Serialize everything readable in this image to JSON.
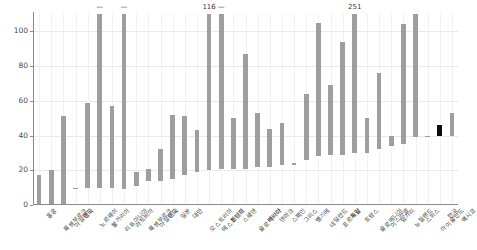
{
  "chart_data": {
    "type": "bar",
    "bar_style": "floating-range",
    "title": "",
    "subtitle": "",
    "xlabel": "",
    "ylabel": "",
    "ylim": [
      0,
      110
    ],
    "y_ticks": [
      0,
      20,
      40,
      60,
      80,
      100
    ],
    "grid": true,
    "legend": null,
    "orientation": "vertical",
    "sorted": "ascending by upper value",
    "clip_value": 110,
    "note": "Each bar spans from a lower value to an upper value. Bars reaching 110 are clipped and carry a numeric annotation of their true upper value.",
    "colors": {
      "bar": "#9e9e9e",
      "highlight_bar": "#0d0d0d",
      "grid": "#e9e9ef",
      "axis": "#8a8a8a",
      "text": "#3c3c3c",
      "background": "#ffffff"
    },
    "categories": [
      "홍콩",
      "룩셈부르크",
      "아일랜드",
      "영국",
      "노르웨이",
      "불가리아",
      "리투아니아",
      "라트비아",
      "룩셈부르크",
      "아일랜드",
      "미국",
      "일본",
      "대만",
      "오스트리아",
      "에스토니아",
      "핀란드",
      "스웨덴",
      "슬로바키아",
      "캐나다",
      "덴마크",
      "스페인",
      "그리스",
      "벨기에",
      "네덜란드",
      "포르투갈",
      "독일",
      "프랑스",
      "슬로베니아",
      "이스라엘",
      "헝가리",
      "뉴질랜드",
      "스위스",
      "아이슬란드",
      "한국",
      "멕시코"
    ],
    "series": [
      {
        "name": "range",
        "points": [
          {
            "category": "홍콩",
            "low": 0,
            "high": 17,
            "clipped": false,
            "highlight": false,
            "annotation": null
          },
          {
            "category": "룩셈부르크",
            "low": 0,
            "high": 20,
            "clipped": false,
            "highlight": false,
            "annotation": null
          },
          {
            "category": "아일랜드",
            "low": 0,
            "high": 51,
            "clipped": false,
            "highlight": false,
            "annotation": null
          },
          {
            "category": "영국",
            "low": 9,
            "high": 10,
            "clipped": false,
            "highlight": false,
            "annotation": null
          },
          {
            "category": "노르웨이",
            "low": 10,
            "high": 59,
            "clipped": false,
            "highlight": false,
            "annotation": null
          },
          {
            "category": "불가리아",
            "low": 10,
            "high": 110,
            "clipped": true,
            "highlight": false,
            "annotation": "—"
          },
          {
            "category": "리투아니아",
            "low": 10,
            "high": 57,
            "clipped": false,
            "highlight": false,
            "annotation": null
          },
          {
            "category": "라트비아",
            "low": 9,
            "high": 110,
            "clipped": true,
            "highlight": false,
            "annotation": "—"
          },
          {
            "category": "룩셈부르크2",
            "low": 11,
            "high": 19,
            "clipped": false,
            "highlight": false,
            "annotation": null
          },
          {
            "category": "아일랜드2",
            "low": 14,
            "high": 21,
            "clipped": false,
            "highlight": false,
            "annotation": null
          },
          {
            "category": "미국",
            "low": 14,
            "high": 32,
            "clipped": false,
            "highlight": false,
            "annotation": null
          },
          {
            "category": "일본",
            "low": 15,
            "high": 52,
            "clipped": false,
            "highlight": false,
            "annotation": null
          },
          {
            "category": "대만",
            "low": 17,
            "high": 51,
            "clipped": false,
            "highlight": false,
            "annotation": null
          },
          {
            "category": "오스트리아",
            "low": 19,
            "high": 43,
            "clipped": false,
            "highlight": false,
            "annotation": null
          },
          {
            "category": "에스토니아",
            "low": 20,
            "high": 110,
            "clipped": true,
            "highlight": false,
            "annotation": "116"
          },
          {
            "category": "핀란드",
            "low": 21,
            "high": 110,
            "clipped": true,
            "highlight": false,
            "annotation": "—"
          },
          {
            "category": "스웨덴",
            "low": 21,
            "high": 50,
            "clipped": false,
            "highlight": false,
            "annotation": null
          },
          {
            "category": "슬로바키아",
            "low": 21,
            "high": 87,
            "clipped": false,
            "highlight": false,
            "annotation": null
          },
          {
            "category": "캐나다",
            "low": 22,
            "high": 53,
            "clipped": false,
            "highlight": false,
            "annotation": null
          },
          {
            "category": "덴마크",
            "low": 22,
            "high": 44,
            "clipped": false,
            "highlight": false,
            "annotation": null
          },
          {
            "category": "스페인",
            "low": 23,
            "high": 47,
            "clipped": false,
            "highlight": false,
            "annotation": null
          },
          {
            "category": "그리스",
            "low": 23,
            "high": 24,
            "clipped": false,
            "highlight": false,
            "annotation": null
          },
          {
            "category": "벨기에",
            "low": 26,
            "high": 64,
            "clipped": false,
            "highlight": false,
            "annotation": null
          },
          {
            "category": "네덜란드",
            "low": 28,
            "high": 105,
            "clipped": false,
            "highlight": false,
            "annotation": null
          },
          {
            "category": "포르투갈",
            "low": 29,
            "high": 69,
            "clipped": false,
            "highlight": false,
            "annotation": null
          },
          {
            "category": "독일",
            "low": 29,
            "high": 94,
            "clipped": false,
            "highlight": false,
            "annotation": null
          },
          {
            "category": "프랑스",
            "low": 30,
            "high": 110,
            "clipped": true,
            "highlight": false,
            "annotation": "251"
          },
          {
            "category": "슬로베니아",
            "low": 30,
            "high": 50,
            "clipped": false,
            "highlight": false,
            "annotation": null
          },
          {
            "category": "이스라엘",
            "low": 32,
            "high": 76,
            "clipped": false,
            "highlight": false,
            "annotation": null
          },
          {
            "category": "헝가리",
            "low": 34,
            "high": 40,
            "clipped": false,
            "highlight": false,
            "annotation": null
          },
          {
            "category": "뉴질랜드",
            "low": 35,
            "high": 104,
            "clipped": false,
            "highlight": false,
            "annotation": null
          },
          {
            "category": "스위스",
            "low": 39,
            "high": 110,
            "clipped": true,
            "highlight": false,
            "annotation": null
          },
          {
            "category": "아이슬란드",
            "low": 39,
            "high": 40,
            "clipped": false,
            "highlight": false,
            "annotation": null
          },
          {
            "category": "한국",
            "low": 40,
            "high": 46,
            "clipped": false,
            "highlight": true,
            "annotation": null
          },
          {
            "category": "멕시코",
            "low": 40,
            "high": 53,
            "clipped": false,
            "highlight": false,
            "annotation": null
          }
        ]
      }
    ]
  }
}
